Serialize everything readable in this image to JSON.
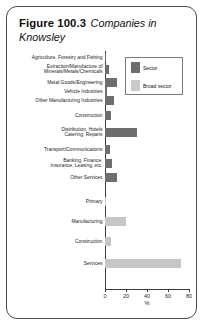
{
  "figure": {
    "number_label": "Figure 100.3",
    "title_rest": "Companies in Knowsley"
  },
  "legend": {
    "position": "top-right",
    "items": [
      {
        "label": "Sector",
        "color": "#6e6e6e"
      },
      {
        "label": "Broad sector",
        "color": "#c9c9c9"
      }
    ]
  },
  "axis": {
    "xlabel": "%",
    "ticks": [
      "0",
      "20",
      "40",
      "60",
      "80"
    ]
  },
  "chart_data": {
    "type": "bar",
    "orientation": "horizontal",
    "title": "Figure 100.3 Companies in Knowsley",
    "xlabel": "%",
    "ylabel": "",
    "xlim": [
      0,
      80
    ],
    "grid": false,
    "legend_position": "top-right",
    "series": [
      {
        "name": "Sector",
        "color": "#6e6e6e",
        "categories": [
          "Agriculture, Forestry and Fishing",
          "Extraction/Manufacture of\nMinerals/Metals/Chemicals",
          "Metal Goods/Engineering",
          "Vehicle Industries",
          "Other Manufacturing Industries",
          "Construction",
          "Distribution, Hotels\nCatering, Repairs",
          "Transport/Communications",
          "Banking, Finance,\nInsurance, Leasing, etc.",
          "Other Services"
        ],
        "values": [
          1,
          4,
          11,
          2,
          9,
          6,
          30,
          5,
          7,
          11
        ]
      },
      {
        "name": "Broad sector",
        "color": "#c9c9c9",
        "categories": [
          "Primary",
          "Manufacturing",
          "Construction",
          "Services"
        ],
        "values": [
          1,
          20,
          6,
          72
        ]
      }
    ],
    "rows": [
      {
        "label": "Agriculture, Forestry and Fishing",
        "series": "Sector",
        "value": 1
      },
      {
        "label": "Extraction/Manufacture of",
        "label2": "Minerals/Metals/Chemicals",
        "series": "Sector",
        "value": 4
      },
      {
        "label": "Metal Goods/Engineering",
        "series": "Sector",
        "value": 11
      },
      {
        "label": "Vehicle Industries",
        "series": "Sector",
        "value": 2
      },
      {
        "label": "Other Manufacturing Industries",
        "series": "Sector",
        "value": 9
      },
      {
        "label": "Construction",
        "series": "Sector",
        "value": 6
      },
      {
        "label": "Distribution, Hotels",
        "label2": "Catering, Repairs",
        "series": "Sector",
        "value": 30
      },
      {
        "label": "Transport/Communications",
        "series": "Sector",
        "value": 5
      },
      {
        "label": "Banking, Finance,",
        "label2": "Insurance, Leasing, etc.",
        "series": "Sector",
        "value": 7
      },
      {
        "label": "Other Services",
        "series": "Sector",
        "value": 11
      },
      {
        "label": "Primary",
        "series": "Broad sector",
        "value": 1
      },
      {
        "label": "Manufacturing",
        "series": "Broad sector",
        "value": 20
      },
      {
        "label": "Construction",
        "series": "Broad sector",
        "value": 6
      },
      {
        "label": "Services",
        "series": "Broad sector",
        "value": 72
      }
    ]
  }
}
